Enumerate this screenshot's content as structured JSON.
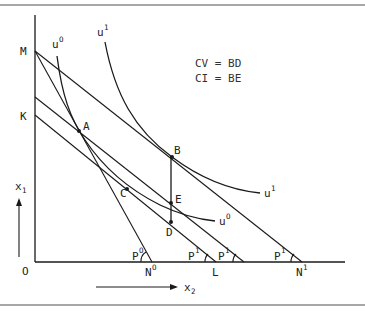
{
  "diagram": {
    "annotations": [
      "CV = BD",
      "CI = BE"
    ],
    "axes": {
      "origin": "O",
      "y_axis": {
        "base": "x",
        "sub": "1"
      },
      "x_axis": {
        "base": "x",
        "sub": "2"
      }
    },
    "vertical_intercepts": [
      "M",
      "K"
    ],
    "horizontal_intercepts": [
      {
        "base": "N",
        "sup": "O"
      },
      {
        "base": "L",
        "sup": ""
      },
      {
        "base": "N",
        "sup": "1"
      }
    ],
    "points": [
      "A",
      "B",
      "C",
      "D",
      "E"
    ],
    "indifference_curves": [
      {
        "base": "u",
        "sup": "O"
      },
      {
        "base": "u",
        "sup": "1"
      }
    ],
    "price_angles": [
      {
        "base": "P",
        "sup": "O"
      },
      {
        "base": "P",
        "sup": "1"
      },
      {
        "base": "P",
        "sup": "1"
      },
      {
        "base": "P",
        "sup": "1"
      }
    ]
  }
}
